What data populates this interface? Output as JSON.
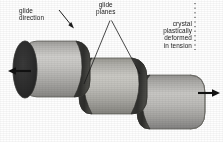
{
  "figure": {
    "background_color": "#fefefe",
    "ink_color": "#1b1b1b"
  },
  "labels": {
    "glide_direction": {
      "line1": "glide",
      "line2": "direction"
    },
    "glide_planes": {
      "line1": "glide",
      "line2": "planes"
    },
    "crystal_state": {
      "line1": "crystal",
      "line2": "plastically",
      "line3": "deformed",
      "line4": "in tension"
    }
  },
  "diagram": {
    "object": "cylindrical single crystal",
    "segment_count": 3,
    "segments": [
      {
        "name": "left-segment",
        "offset_x": 0,
        "offset_y": 0
      },
      {
        "name": "middle-segment",
        "offset_x": 58,
        "offset_y": 17
      },
      {
        "name": "right-segment",
        "offset_x": 116,
        "offset_y": 34
      }
    ],
    "colors": {
      "body_light": "#c9c8c6",
      "body_mid": "#a9a8a6",
      "body_dark": "#8a8987",
      "end_face_dark": "#2b2b2b",
      "glide_face_dark": "#3a3a38",
      "outline": "#4a4a48"
    },
    "arrows": [
      {
        "name": "tension-arrow-left",
        "direction": "left",
        "x": 15,
        "y": 71
      },
      {
        "name": "tension-arrow-right",
        "direction": "right",
        "x": 205,
        "y": 93
      },
      {
        "name": "glide-direction-arrow",
        "direction": "down-right",
        "x1": 60,
        "y1": 11,
        "x2": 73,
        "y2": 27
      }
    ],
    "leader_lines": [
      {
        "name": "glide-planes-leader-left",
        "from_x": 110,
        "from_y": 21,
        "to_x": 84,
        "to_y": 84
      },
      {
        "name": "glide-planes-leader-right",
        "from_x": 111,
        "from_y": 21,
        "to_x": 139,
        "to_y": 73
      },
      {
        "name": "crystal-state-dashed-leader",
        "x": 195,
        "y1": 3,
        "y2": 50,
        "style": "dashed-vertical"
      }
    ]
  }
}
